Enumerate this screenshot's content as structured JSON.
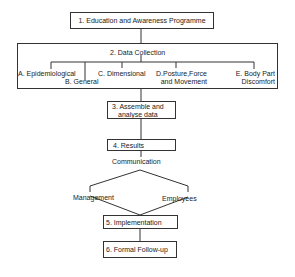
{
  "diagram": {
    "steps": [
      {
        "id": 1,
        "label": "1. Education and Awareness Programme"
      },
      {
        "id": 2,
        "label": "2. Data Collection",
        "sub_items": [
          {
            "id": "A",
            "label": "A. Epidemiological"
          },
          {
            "id": "B",
            "label": "B. General"
          },
          {
            "id": "C",
            "label": "C. Dimensional"
          },
          {
            "id": "D",
            "line1": "D.Posture,Force",
            "line2": "and Movement"
          },
          {
            "id": "E",
            "line1": "E. Body Part",
            "line2": "Discomfort"
          }
        ]
      },
      {
        "id": 3,
        "line1": "3. Assemble and",
        "line2": "analyse data"
      },
      {
        "id": 4,
        "label": "4. Results"
      },
      {
        "id": 5,
        "label": "5. Implementation"
      },
      {
        "id": 6,
        "label": "6. Formal Follow-up"
      }
    ],
    "communication": {
      "label": "Communication",
      "branches": [
        "Management",
        "Employees"
      ]
    },
    "colors": {
      "line": "#333333",
      "background": "#ffffff",
      "text": "#222222"
    }
  }
}
